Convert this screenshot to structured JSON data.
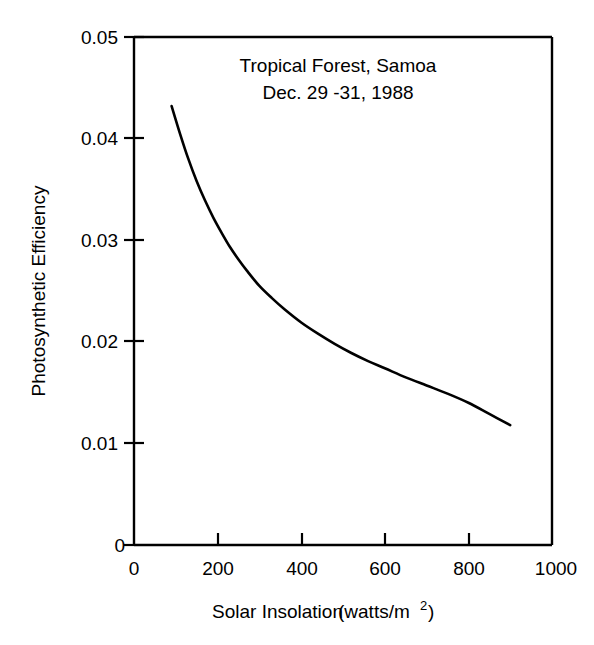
{
  "chart_data": {
    "type": "line",
    "title": "",
    "annotations": [
      "Tropical Forest, Samoa",
      "Dec. 29 -31, 1988"
    ],
    "xlabel_main": "Solar Insolation",
    "xlabel_units": "(watts/m",
    "xlabel_units_sup": "2",
    "xlabel_units_close": ")",
    "xlabel": "Solar Insolation  (watts/m2)",
    "ylabel": "Photosynthetic Efficiency",
    "xlim": [
      0,
      1000
    ],
    "ylim": [
      0,
      0.05
    ],
    "xticks": [
      0,
      200,
      400,
      600,
      800,
      1000
    ],
    "xtick_labels": [
      "0",
      "200",
      "400",
      "600",
      "800",
      "1000"
    ],
    "yticks": [
      0,
      0.01,
      0.02,
      0.03,
      0.04,
      0.05
    ],
    "ytick_labels": [
      "0",
      "0.01",
      "0.02",
      "0.03",
      "0.04",
      "0.05"
    ],
    "grid": false,
    "legend": false,
    "line_color": "#000000",
    "background_color": "#ffffff",
    "series": [
      {
        "name": "Photosynthetic Efficiency",
        "x": [
          90,
          110,
          130,
          150,
          170,
          190,
          210,
          230,
          250,
          270,
          300,
          330,
          360,
          400,
          440,
          480,
          520,
          560,
          600,
          650,
          700,
          750,
          800,
          850,
          900
        ],
        "y": [
          0.0432,
          0.0405,
          0.038,
          0.0358,
          0.0339,
          0.0322,
          0.0307,
          0.0293,
          0.0281,
          0.027,
          0.0255,
          0.0243,
          0.0232,
          0.0219,
          0.0208,
          0.0198,
          0.0189,
          0.0181,
          0.0174,
          0.0165,
          0.0157,
          0.0149,
          0.014,
          0.0129,
          0.0118
        ]
      }
    ]
  },
  "axes": {
    "x_label_text": "Solar Insolation",
    "y_label_text": "Photosynthetic Efficiency"
  }
}
